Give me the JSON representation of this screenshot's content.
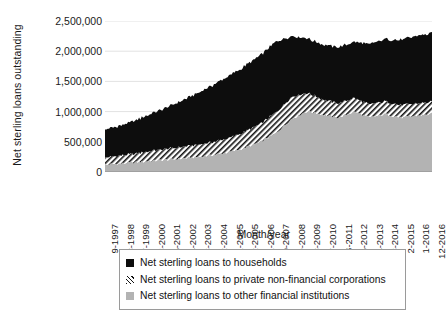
{
  "chart_data": {
    "type": "area",
    "stacked": true,
    "title": "",
    "xlabel": "Month/year",
    "ylabel": "Net sterling loans outstanding",
    "ylim": [
      0,
      2500000
    ],
    "yticks": [
      0,
      500000,
      1000000,
      1500000,
      2000000,
      2500000
    ],
    "ytick_labels": [
      "0",
      "500,000",
      "1,000,000",
      "1,500,000",
      "2,000,000",
      "2,500,000"
    ],
    "grid": true,
    "legend_position": "bottom",
    "categories": [
      "9-1997",
      "8-1998",
      "7-1999",
      "6-2000",
      "5-2001",
      "4-2002",
      "3-2003",
      "2-2004",
      "1-2005",
      "12-2005",
      "11-2006",
      "10-2007",
      "9-2008",
      "8-2009",
      "7-2010",
      "6-2011",
      "5-2012",
      "4-2013",
      "3-2014",
      "2-2015",
      "1-2016",
      "12-2016"
    ],
    "series": [
      {
        "name": "Net sterling loans to other financial institutions",
        "fill": "#b3b3b3",
        "pattern": "solid",
        "values": [
          120000,
          140000,
          160000,
          185000,
          205000,
          225000,
          250000,
          285000,
          330000,
          400000,
          500000,
          650000,
          880000,
          1010000,
          950000,
          900000,
          1000000,
          900000,
          960000,
          900000,
          930000,
          960000
        ]
      },
      {
        "name": "Net sterling loans to private non-financial corporations",
        "fill": "#ffffff",
        "pattern": "diagonal-hatch",
        "values": [
          120000,
          130000,
          145000,
          165000,
          180000,
          190000,
          200000,
          215000,
          235000,
          265000,
          300000,
          340000,
          370000,
          300000,
          250000,
          235000,
          225000,
          215000,
          210000,
          205000,
          200000,
          200000
        ]
      },
      {
        "name": "Net sterling loans to households",
        "fill": "#0d0d0d",
        "pattern": "solid",
        "values": [
          460000,
          500000,
          555000,
          620000,
          690000,
          770000,
          860000,
          950000,
          1030000,
          1090000,
          1140000,
          1170000,
          1000000,
          900000,
          910000,
          930000,
          930000,
          1000000,
          1030000,
          1080000,
          1120000,
          1140000
        ]
      }
    ],
    "peak_note": "Total peaks near 2,300,000 at 12-2016"
  },
  "legend": {
    "items": [
      {
        "label": "Net sterling loans to households",
        "swatch": "black-square-icon"
      },
      {
        "label": "Net sterling loans to private non-financial corporations",
        "swatch": "hatched-square-icon"
      },
      {
        "label": "Net sterling loans to other financial institutions",
        "swatch": "gray-square-icon"
      }
    ]
  }
}
